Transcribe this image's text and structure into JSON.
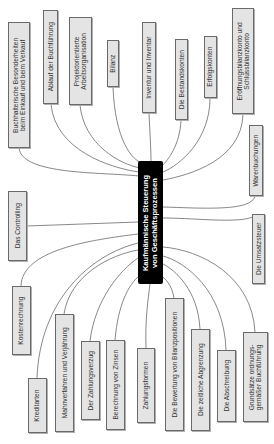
{
  "diagram": {
    "type": "mind-map",
    "center": {
      "label": "Kaufmännische Steuerung\nvon Geschäftsprozessen"
    },
    "colors": {
      "node_fill": "#e4e4e4",
      "node_border": "#6a6a6a",
      "center_fill": "#000000",
      "line": "#555555"
    },
    "nodes": [
      {
        "label": "Buchhalterische Besonderheiten\nbeim Einkauf und beim Verkauf"
      },
      {
        "label": "Ablauf der Buchführung"
      },
      {
        "label": "Projektorientierte\nArbeitsorganisation"
      },
      {
        "label": "Bilanz"
      },
      {
        "label": "Inventur und Inventar"
      },
      {
        "label": "Die Bestandskonten"
      },
      {
        "label": "Erfolgskonten"
      },
      {
        "label": "Eröffnungsbilanzkonto und\nSchlussbilanzkonto"
      },
      {
        "label": "Warenbuchungen"
      },
      {
        "label": "Die Umsatzsteuer"
      },
      {
        "label": "Das Controlling"
      },
      {
        "label": "Kostenrechnung"
      },
      {
        "label": "Kreditarten"
      },
      {
        "label": "Mahnverfahren und Verjährung"
      },
      {
        "label": "Der Zahlungsverzug"
      },
      {
        "label": "Berechnung von Zinsen"
      },
      {
        "label": "Zahlungsformen"
      },
      {
        "label": "Die Bewertung von Bilanzpositionen"
      },
      {
        "label": "Die zeitliche Abgrenzung"
      },
      {
        "label": "Die Abschreibung"
      },
      {
        "label": "Grundsätze ordnungs-\ngemäßer Buchführung"
      }
    ]
  }
}
